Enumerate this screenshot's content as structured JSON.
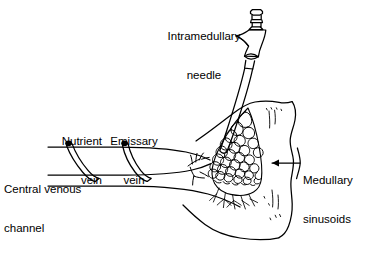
{
  "figure": {
    "domain": "medical-anatomical-line-diagram",
    "width": 383,
    "height": 264,
    "background_color": "#ffffff",
    "line_color": "#000000",
    "text_color": "#000000"
  },
  "labels": {
    "needle": "Intramedullary\nneedle",
    "needle_line1": "Intramedullary",
    "needle_line2": "needle",
    "nutrient_vein": "Nutrient\nvein",
    "nutrient_vein_line1": "Nutrient",
    "nutrient_vein_line2": "vein",
    "emissary_vein": "Emissary\nvein",
    "emissary_vein_line1": "Emissary",
    "emissary_vein_line2": "vein",
    "central_venous_channel": "Central venous\nchannel",
    "central_venous_channel_line1": "Central venous",
    "central_venous_channel_line2": "channel",
    "medullary_sinusoids": "Medullary\nsinusoids",
    "medullary_sinusoids_line1": "Medullary",
    "medullary_sinusoids_line2": "sinusoids"
  },
  "annotations": {
    "sinusoid_pointer": "leader-line-with-arrowhead-pointing-left-into-marrow",
    "sinusoid_brace": "vertical-wavy-brace-at-right-edge-of-bone"
  },
  "structures": {
    "needle": "hub-with-ringed-cap-flared-body-and-tapered-shaft",
    "bone": "long-bone-metaphysis-cortical-outline",
    "marrow_network": "honeycomb-polygonal-sinusoid-mesh",
    "vessels": "central-venous-channel-with-two-tributary-veins"
  }
}
